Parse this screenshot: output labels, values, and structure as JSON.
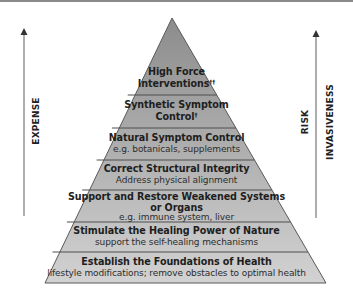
{
  "colors": {
    "tier_top": "#8f8f8f",
    "tier_bottom": "#cfcfcf",
    "outline": "#555555",
    "arrow": "#777777"
  },
  "axes": {
    "left": {
      "label": "EXPENSE",
      "direction": "up"
    },
    "right": {
      "labels": [
        "RISK",
        "INVASIVENESS"
      ],
      "direction": "up"
    }
  },
  "tiers": [
    {
      "title_line1": "High Force",
      "title_line2": "Interventions",
      "mark": "††",
      "subtitle": ""
    },
    {
      "title_line1": "Synthetic Symptom",
      "title_line2": "Control",
      "mark": "†",
      "subtitle": ""
    },
    {
      "title_line1": "Natural Symptom Control",
      "title_line2": "",
      "mark": "",
      "subtitle": "e.g. botanicals, supplements"
    },
    {
      "title_line1": "Correct Structural Integrity",
      "title_line2": "",
      "mark": "",
      "subtitle": "Address physical alignment"
    },
    {
      "title_line1": "Support and Restore Weakened Systems",
      "title_line2": "or Organs",
      "mark": "",
      "subtitle": "e.g. immune system, liver"
    },
    {
      "title_line1": "Stimulate the Healing Power of Nature",
      "title_line2": "",
      "mark": "",
      "subtitle": "support the self-healing mechanisms"
    },
    {
      "title_line1": "Establish the Foundations of Health",
      "title_line2": "",
      "mark": "",
      "subtitle": "lifestyle modifications; remove obstacles to optimal health"
    }
  ]
}
